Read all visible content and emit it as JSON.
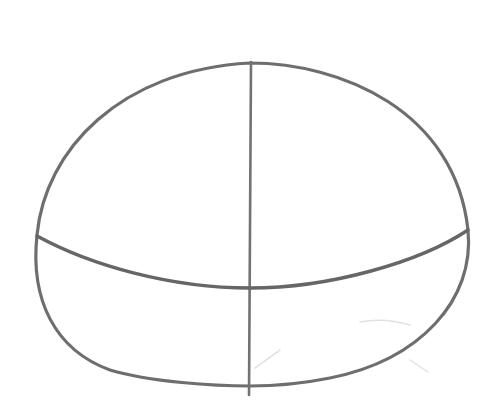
{
  "image": {
    "description": "Pencil sketch of a head construction oval with a vertical center line and a curved horizontal guideline",
    "background_color": "#ffffff",
    "stroke_color": "#6e6e6e",
    "faint_stroke_color": "#d8d8d8"
  }
}
